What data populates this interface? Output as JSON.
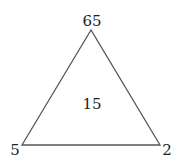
{
  "diagram": {
    "shape": "triangle",
    "vertices": {
      "top": "65",
      "bottom_left": "5",
      "bottom_right": "2"
    },
    "center": "15",
    "colors": {
      "line": "#555555",
      "text": "#222222",
      "background": "#ffffff"
    }
  }
}
